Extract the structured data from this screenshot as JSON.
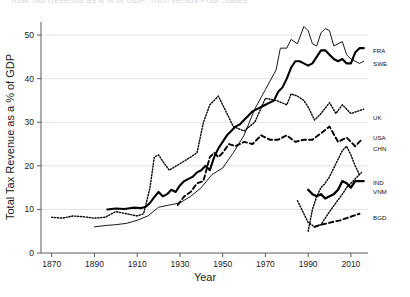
{
  "figure": {
    "title_cutoff": "Total Tax Revenue as a % of GDP: Rich versus Poor States",
    "xlabel": "Year",
    "ylabel": "Total Tax Revenue as a % of GDP"
  },
  "chart_data": {
    "type": "line",
    "title": "Total Tax Revenue as a % of GDP: Rich versus Poor States",
    "xlabel": "Year",
    "ylabel": "Total Tax Revenue as a % of GDP",
    "xlim": [
      1865,
      2018
    ],
    "ylim": [
      0,
      53
    ],
    "xticks": [
      1870,
      1890,
      1910,
      1930,
      1950,
      1970,
      1990,
      2010
    ],
    "yticks": [
      0,
      10,
      20,
      30,
      40,
      50
    ],
    "grid": "horizontal",
    "legend_position": "right-inline",
    "series": [
      {
        "name": "FRA",
        "label": "FRA",
        "style": "solid-thick",
        "stroke_width": 2.1,
        "label_y_value": 46.5,
        "x": [
          1896,
          1900,
          1904,
          1908,
          1912,
          1914,
          1916,
          1918,
          1920,
          1922,
          1924,
          1926,
          1928,
          1930,
          1932,
          1934,
          1936,
          1938,
          1940,
          1942,
          1944,
          1946,
          1948,
          1950,
          1952,
          1954,
          1956,
          1958,
          1960,
          1962,
          1964,
          1966,
          1968,
          1970,
          1972,
          1974,
          1976,
          1978,
          1980,
          1982,
          1984,
          1986,
          1988,
          1990,
          1992,
          1994,
          1996,
          1998,
          2000,
          2002,
          2004,
          2006,
          2008,
          2010,
          2012,
          2014,
          2016
        ],
        "y": [
          10.0,
          10.2,
          10.1,
          10.4,
          10.3,
          10.6,
          11.5,
          12.8,
          14.0,
          13.0,
          13.5,
          14.5,
          14.0,
          15.5,
          16.5,
          17.0,
          17.5,
          18.5,
          19.0,
          20.0,
          19.0,
          22.0,
          24.0,
          25.5,
          27.0,
          28.0,
          29.0,
          29.5,
          30.5,
          31.5,
          32.5,
          33.0,
          33.5,
          34.0,
          34.5,
          35.0,
          37.0,
          38.0,
          40.0,
          42.5,
          44.0,
          44.0,
          43.5,
          43.0,
          43.5,
          45.0,
          46.5,
          46.5,
          45.5,
          44.5,
          44.0,
          44.5,
          43.5,
          43.5,
          46.0,
          47.0,
          47.0
        ]
      },
      {
        "name": "SWE",
        "label": "SWE",
        "style": "solid-thin",
        "stroke_width": 0.9,
        "label_y_value": 43.5,
        "x": [
          1890,
          1895,
          1900,
          1905,
          1910,
          1915,
          1920,
          1925,
          1930,
          1935,
          1940,
          1945,
          1950,
          1955,
          1960,
          1965,
          1970,
          1975,
          1977,
          1980,
          1982,
          1985,
          1988,
          1990,
          1992,
          1994,
          1996,
          1998,
          2000,
          2002,
          2004,
          2006,
          2008,
          2010,
          2012,
          2014,
          2016
        ],
        "y": [
          6.0,
          6.3,
          6.5,
          6.8,
          7.5,
          8.5,
          10.5,
          11.0,
          11.5,
          13.0,
          15.0,
          18.0,
          19.5,
          23.0,
          27.0,
          33.0,
          37.5,
          42.0,
          47.0,
          47.0,
          49.0,
          48.0,
          52.0,
          51.0,
          48.0,
          47.5,
          50.5,
          51.5,
          51.0,
          47.5,
          48.0,
          48.5,
          45.5,
          44.5,
          44.0,
          43.5,
          44.0
        ]
      },
      {
        "name": "UK",
        "label": "UK",
        "style": "dotted",
        "stroke_width": 1.4,
        "label_y_value": 31.0,
        "x": [
          1870,
          1875,
          1880,
          1885,
          1890,
          1895,
          1900,
          1905,
          1910,
          1913,
          1916,
          1918,
          1920,
          1922,
          1925,
          1930,
          1935,
          1938,
          1941,
          1944,
          1946,
          1948,
          1950,
          1955,
          1960,
          1965,
          1970,
          1975,
          1980,
          1982,
          1985,
          1988,
          1990,
          1993,
          1996,
          2000,
          2003,
          2006,
          2008,
          2010,
          2013,
          2016
        ],
        "y": [
          8.2,
          8.0,
          8.5,
          8.3,
          8.0,
          8.2,
          9.5,
          9.0,
          8.5,
          9.0,
          15.0,
          22.0,
          22.5,
          21.0,
          19.0,
          20.5,
          22.0,
          23.0,
          30.0,
          34.0,
          35.0,
          36.0,
          34.0,
          29.0,
          28.0,
          30.0,
          35.5,
          35.0,
          34.0,
          36.5,
          36.0,
          35.0,
          33.5,
          30.5,
          32.0,
          34.5,
          32.0,
          34.0,
          33.0,
          32.0,
          32.5,
          33.0
        ]
      },
      {
        "name": "USA",
        "label": "USA",
        "style": "dashed",
        "stroke_width": 1.9,
        "label_y_value": 26.5,
        "x": [
          1929,
          1932,
          1935,
          1938,
          1941,
          1944,
          1946,
          1948,
          1950,
          1953,
          1956,
          1960,
          1964,
          1968,
          1972,
          1976,
          1980,
          1984,
          1988,
          1992,
          1996,
          2000,
          2004,
          2008,
          2012,
          2015
        ],
        "y": [
          11.0,
          13.0,
          14.0,
          16.0,
          16.5,
          22.0,
          23.0,
          22.0,
          23.0,
          25.0,
          24.5,
          25.5,
          25.0,
          27.0,
          26.0,
          26.0,
          27.0,
          25.5,
          26.0,
          26.0,
          27.5,
          29.0,
          25.5,
          26.5,
          24.5,
          26.0
        ]
      },
      {
        "name": "CHN",
        "label": "CHN",
        "style": "dotted",
        "stroke_width": 1.4,
        "label_y_value": 24.0,
        "x": [
          1985,
          1988,
          1990,
          1993,
          1996,
          1998,
          2000,
          2003,
          2006,
          2008,
          2010,
          2013,
          2015
        ],
        "y": [
          12.0,
          9.0,
          7.0,
          6.0,
          6.5,
          8.0,
          9.5,
          11.5,
          13.5,
          15.0,
          16.0,
          17.5,
          18.5
        ]
      },
      {
        "name": "IND",
        "label": "IND",
        "style": "solid-thick",
        "stroke_width": 2.3,
        "label_y_value": 16.0,
        "x": [
          1990,
          1992,
          1994,
          1996,
          1998,
          2000,
          2002,
          2004,
          2006,
          2008,
          2010,
          2012,
          2014,
          2016
        ],
        "y": [
          14.5,
          13.5,
          13.0,
          13.5,
          12.5,
          13.0,
          13.5,
          14.5,
          16.5,
          16.0,
          15.0,
          16.5,
          16.5,
          16.5
        ]
      },
      {
        "name": "VNM",
        "label": "VNM",
        "style": "dotted",
        "stroke_width": 1.4,
        "label_y_value": 14.0,
        "x": [
          1990,
          1992,
          1994,
          1996,
          1998,
          2000,
          2002,
          2004,
          2006,
          2008,
          2010,
          2012,
          2014
        ],
        "y": [
          5.0,
          10.0,
          13.0,
          15.0,
          16.0,
          17.5,
          19.5,
          21.5,
          23.5,
          24.5,
          22.5,
          20.0,
          18.0
        ]
      },
      {
        "name": "BGD",
        "label": "BGD",
        "style": "dashed",
        "stroke_width": 1.9,
        "label_y_value": 8.0,
        "x": [
          1993,
          1996,
          1999,
          2002,
          2005,
          2008,
          2011,
          2014
        ],
        "y": [
          6.0,
          6.5,
          6.8,
          7.2,
          7.5,
          8.0,
          8.5,
          9.0
        ]
      }
    ]
  }
}
